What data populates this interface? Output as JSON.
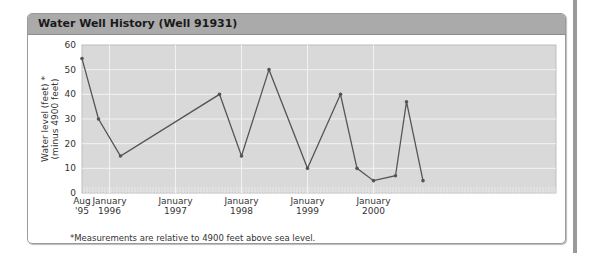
{
  "panel": {
    "title": "Water Well History (Well 91931)",
    "footnote": "*Measurements are relative to 4900 feet above sea level."
  },
  "chart_data": {
    "type": "line",
    "title": "Water Well History (Well 91931)",
    "xlabel": "",
    "ylabel": "Water level (feet)* (minus 4900 feet)",
    "ylabel_lines": [
      "Water level (feet) *",
      "(minus 4900 feet)"
    ],
    "ylim": [
      0,
      60
    ],
    "yticks": [
      0,
      10,
      20,
      30,
      40,
      50,
      60
    ],
    "xtick_labels": [
      {
        "line1": "Aug",
        "line2": "'95"
      },
      {
        "line1": "January",
        "line2": "1996"
      },
      {
        "line1": "January",
        "line2": "1997"
      },
      {
        "line1": "January",
        "line2": "1998"
      },
      {
        "line1": "January",
        "line2": "1999"
      },
      {
        "line1": "January",
        "line2": "2000"
      }
    ],
    "grid": true,
    "legend": null,
    "series": [
      {
        "name": "Water level",
        "color": "#555555",
        "points": [
          {
            "x": "1995-08",
            "y": 54.5
          },
          {
            "x": "1995-11",
            "y": 30
          },
          {
            "x": "1996-03",
            "y": 15
          },
          {
            "x": "1997-09",
            "y": 40
          },
          {
            "x": "1998-01",
            "y": 15
          },
          {
            "x": "1998-06",
            "y": 50
          },
          {
            "x": "1999-01",
            "y": 10
          },
          {
            "x": "1999-07",
            "y": 40
          },
          {
            "x": "1999-10",
            "y": 10
          },
          {
            "x": "2000-01",
            "y": 5
          },
          {
            "x": "2000-05",
            "y": 7
          },
          {
            "x": "2000-07",
            "y": 37
          },
          {
            "x": "2000-10",
            "y": 5
          }
        ]
      }
    ]
  },
  "colors": {
    "header": "#aaaaaa",
    "plot_bg": "#d9d9d9",
    "grid": "#f2f2f2",
    "line": "#555555"
  }
}
